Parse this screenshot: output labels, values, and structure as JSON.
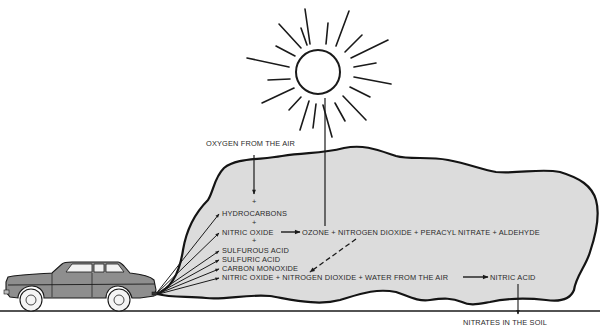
{
  "diagram": {
    "colors": {
      "cloud_fill": "#dcdcdc",
      "ink": "#1a1a1a",
      "background": "#ffffff"
    },
    "labels": {
      "oxygen": "OXYGEN FROM THE AIR",
      "plus1": "+",
      "hydrocarbons": "HYDROCARBONS",
      "plus2": "+",
      "nitric_oxide": "NITRIC OXIDE",
      "plus3": "+",
      "ozone_line": "OZONE + NITROGEN DIOXIDE + PERACYL NITRATE + ALDEHYDE",
      "sulfurous_acid": "SULFUROUS ACID",
      "sulfuric_acid": "SULFURIC ACID",
      "carbon_monoxide": "CARBON MONOXIDE",
      "no_line": "NITRIC OXIDE + NITROGEN DIOXIDE + WATER FROM THE AIR",
      "nitric_acid": "NITRIC ACID",
      "nitrates": "NITRATES IN THE SOIL"
    },
    "icons": [
      "sun-icon",
      "car-icon",
      "smog-cloud"
    ]
  }
}
